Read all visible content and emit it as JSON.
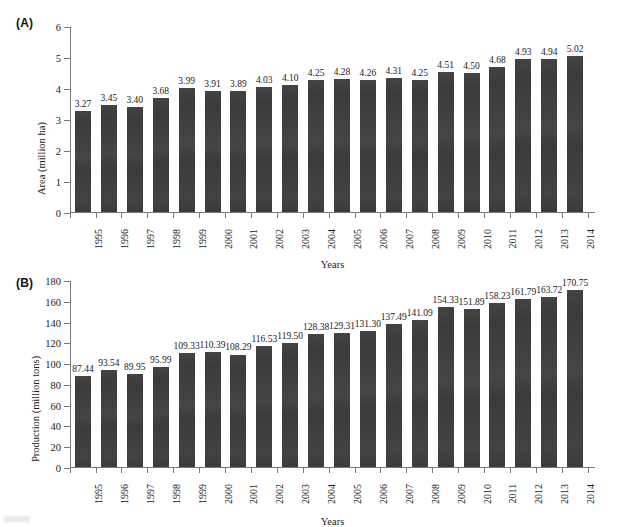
{
  "figure": {
    "background": "#ffffff",
    "bar_color": "#3b3b3b",
    "axis_color": "#7a7a7a",
    "smudge_name": "scan-artifact"
  },
  "panels": [
    {
      "tag": "(A)",
      "tag_name": "panel-a-tag",
      "ylabel": "Area (million ha)",
      "xlabel": "Years"
    },
    {
      "tag": "(B)",
      "tag_name": "panel-b-tag",
      "ylabel": "Production (million tons)",
      "xlabel": "Years"
    }
  ],
  "chart_data": [
    {
      "type": "bar",
      "panel": "(A)",
      "title": "",
      "xlabel": "Years",
      "ylabel": "Area (million ha)",
      "ylim": [
        0,
        6
      ],
      "yticks": [
        0,
        1,
        2,
        3,
        4,
        5,
        6
      ],
      "grid": false,
      "legend": "none",
      "categories": [
        "1995",
        "1996",
        "1997",
        "1998",
        "1999",
        "2000",
        "2001",
        "2002",
        "2003",
        "2004",
        "2005",
        "2006",
        "2007",
        "2008",
        "2009",
        "2010",
        "2011",
        "2012",
        "2013",
        "2014"
      ],
      "values": [
        3.27,
        3.45,
        3.4,
        3.68,
        3.99,
        3.91,
        3.89,
        4.03,
        4.1,
        4.25,
        4.28,
        4.26,
        4.31,
        4.25,
        4.51,
        4.5,
        4.68,
        4.93,
        4.94,
        5.02
      ],
      "value_labels": [
        "3.27",
        "3.45",
        "3.40",
        "3.68",
        "3.99",
        "3.91",
        "3.89",
        "4.03",
        "4.10",
        "4.25",
        "4.28",
        "4.26",
        "4.31",
        "4.25",
        "4.51",
        "4.50",
        "4.68",
        "4.93",
        "4.94",
        "5.02"
      ]
    },
    {
      "type": "bar",
      "panel": "(B)",
      "title": "",
      "xlabel": "Years",
      "ylabel": "Production (million tons)",
      "ylim": [
        0,
        180
      ],
      "yticks": [
        0,
        20,
        40,
        60,
        80,
        100,
        120,
        140,
        160,
        180
      ],
      "grid": false,
      "legend": "none",
      "categories": [
        "1995",
        "1996",
        "1997",
        "1998",
        "1999",
        "2000",
        "2001",
        "2002",
        "2003",
        "2004",
        "2005",
        "2006",
        "2007",
        "2008",
        "2009",
        "2010",
        "2011",
        "2012",
        "2013",
        "2014"
      ],
      "values": [
        87.44,
        93.54,
        89.95,
        95.99,
        109.33,
        110.39,
        108.29,
        116.53,
        119.5,
        128.38,
        129.31,
        131.3,
        137.49,
        141.09,
        154.33,
        151.89,
        158.23,
        161.79,
        163.72,
        170.75
      ],
      "value_labels": [
        "87.44",
        "93.54",
        "89.95",
        "95.99",
        "109.33",
        "110.39",
        "108.29",
        "116.53",
        "119.50",
        "128.38",
        "129.31",
        "131.30",
        "137.49",
        "141.09",
        "154.33",
        "151.89",
        "158.23",
        "161.79",
        "163.72",
        "170.75"
      ]
    }
  ]
}
